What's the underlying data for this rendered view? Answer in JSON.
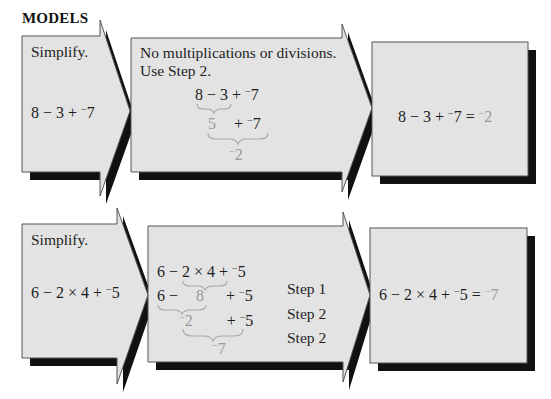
{
  "heading": "MODELS",
  "examples": [
    {
      "problem": {
        "label": "Simplify.",
        "expression": [
          "8",
          "−",
          "3",
          "+",
          "7"
        ]
      },
      "work": {
        "note_line1": "No multiplications or divisions.",
        "note_line2": "Use Step 2.",
        "line1": {
          "a": "8",
          "op1": "−",
          "b": "3",
          "op2": "+",
          "c": "7"
        },
        "line2": {
          "a": "5",
          "op": "+",
          "c": "7"
        },
        "line3": {
          "result": "2"
        }
      },
      "answer": {
        "expression": "8 − 3 +",
        "neg_value": "7",
        "equals": "=",
        "result": "2"
      }
    },
    {
      "problem": {
        "label": "Simplify.",
        "expression": [
          "6",
          "−",
          "2",
          "×",
          "4",
          "+",
          "5"
        ]
      },
      "work": {
        "line1": {
          "a": "6",
          "op1": "−",
          "b": "2",
          "op2": "×",
          "c": "4",
          "op3": "+",
          "d": "5"
        },
        "line2": {
          "a": "6",
          "op1": "−",
          "b": "8",
          "op2": "+",
          "d": "5"
        },
        "line3": {
          "a": "2",
          "op": "+",
          "d": "5"
        },
        "line4": {
          "result": "7"
        },
        "steps": [
          "Step 1",
          "Step 2",
          "Step 2"
        ]
      },
      "answer": {
        "expression": "6 − 2 × 4 +",
        "neg_value": "5",
        "equals": "=",
        "result": "7"
      }
    }
  ],
  "colors": {
    "panel_fill": "#e4e4e4",
    "panel_stroke": "#555555",
    "shadow": "#111111",
    "highlight_text": "#9a9a9a"
  }
}
